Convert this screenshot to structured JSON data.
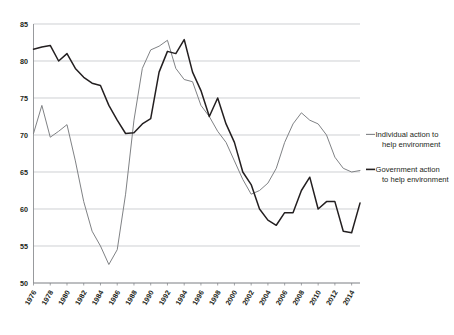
{
  "chart_data": {
    "type": "line",
    "title": "",
    "subtitle": "",
    "xlabel": "",
    "ylabel": "",
    "xlim": [
      1976,
      2015
    ],
    "ylim": [
      50,
      85
    ],
    "ytick_step": 5,
    "grid": true,
    "legend_position": "right",
    "yticks": [
      85,
      80,
      75,
      70,
      65,
      60,
      55,
      50
    ],
    "xticks": [
      1976,
      1978,
      1980,
      1982,
      1984,
      1986,
      1988,
      1990,
      1992,
      1994,
      1996,
      1998,
      2000,
      2002,
      2004,
      2006,
      2008,
      2010,
      2012,
      2014
    ],
    "x": [
      1976,
      1977,
      1978,
      1979,
      1980,
      1981,
      1982,
      1983,
      1984,
      1985,
      1986,
      1987,
      1988,
      1989,
      1990,
      1991,
      1992,
      1993,
      1994,
      1995,
      1996,
      1997,
      1998,
      1999,
      2000,
      2001,
      2002,
      2003,
      2004,
      2005,
      2006,
      2007,
      2008,
      2009,
      2010,
      2011,
      2012,
      2013,
      2014,
      2015
    ],
    "series": [
      {
        "name": "Individual action to help environment",
        "color": "#808285",
        "values": [
          70.2,
          74.0,
          69.7,
          70.5,
          71.4,
          66.5,
          61.0,
          57.0,
          55.0,
          52.5,
          54.5,
          62.0,
          72.0,
          79.0,
          81.5,
          82.0,
          82.8,
          79.0,
          77.5,
          77.2,
          74.0,
          72.5,
          70.5,
          69.0,
          66.5,
          64.0,
          62.0,
          62.5,
          63.5,
          65.5,
          69.0,
          71.5,
          73.0,
          72.0,
          71.5,
          70.0,
          67.0,
          65.5,
          65.0,
          65.2
        ]
      },
      {
        "name": "Government action to help environment",
        "color": "#231f20",
        "values": [
          81.6,
          81.9,
          82.1,
          80.0,
          81.0,
          79.0,
          77.8,
          77.0,
          76.7,
          74.0,
          72.0,
          70.2,
          70.3,
          71.5,
          72.2,
          78.5,
          81.3,
          81.0,
          82.9,
          78.5,
          76.0,
          72.5,
          75.0,
          71.5,
          69.0,
          65.0,
          63.3,
          60.0,
          58.5,
          57.8,
          59.5,
          59.5,
          62.5,
          64.3,
          60.0,
          61.0,
          61.0,
          57.0,
          56.8,
          60.8
        ]
      }
    ],
    "legend": [
      {
        "label_line1": "Individual action to",
        "label_line2": "help environment",
        "color": "#808285"
      },
      {
        "label_line1": "Government action",
        "label_line2": "to help environment",
        "color": "#231f20"
      }
    ]
  }
}
